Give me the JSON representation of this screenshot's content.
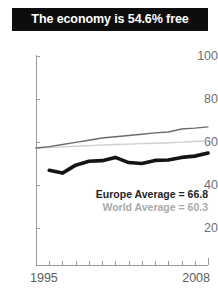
{
  "title": {
    "text": "The economy is 54.6% free"
  },
  "legend": {
    "europe": "Europe Average = 66.8",
    "world": "World Average = 60.3"
  },
  "axis": {
    "y_ticks": [
      "100",
      "80",
      "60",
      "40",
      "20"
    ],
    "x_start_label": "1995",
    "x_end_label": "2008"
  },
  "colors": {
    "banner_bg": "#0d0d0d",
    "banner_text": "#ffffff",
    "country_line": "#141414",
    "europe_line": "#6b6b6b",
    "world_line": "#cfcfcf",
    "axis": "#9a9a9a",
    "tick_text": "#6f6f6f"
  },
  "chart_data": {
    "type": "line",
    "title": "The economy is 54.6% free",
    "xlabel": "",
    "ylabel": "",
    "xlim": [
      1995,
      2008
    ],
    "ylim": [
      0,
      100
    ],
    "yticks": [
      20,
      40,
      60,
      80,
      100
    ],
    "grid": false,
    "legend_position": "inside-right",
    "x": [
      1995,
      1996,
      1997,
      1998,
      1999,
      2000,
      2001,
      2002,
      2003,
      2004,
      2005,
      2006,
      2007,
      2008
    ],
    "series": [
      {
        "name": "Country score",
        "style": "thick-black",
        "color": "#141414",
        "values": [
          null,
          46.6,
          45.3,
          49.0,
          50.8,
          51.1,
          52.6,
          50.2,
          49.8,
          51.2,
          51.4,
          52.6,
          53.2,
          54.6
        ]
      },
      {
        "name": "Europe Average",
        "style": "thin-dark-gray",
        "color": "#6b6b6b",
        "label_value": 66.8,
        "values": [
          57.0,
          57.6,
          58.6,
          59.6,
          60.6,
          61.6,
          62.2,
          62.8,
          63.4,
          64.0,
          64.4,
          65.8,
          66.2,
          66.8
        ]
      },
      {
        "name": "World Average",
        "style": "thin-light-gray",
        "color": "#cfcfcf",
        "label_value": 60.3,
        "values": [
          57.0,
          57.2,
          57.5,
          57.8,
          58.1,
          58.4,
          58.6,
          58.8,
          59.0,
          59.2,
          59.4,
          59.7,
          60.0,
          60.3
        ]
      }
    ],
    "annotations": [
      "Europe Average = 66.8",
      "World Average = 60.3"
    ]
  }
}
